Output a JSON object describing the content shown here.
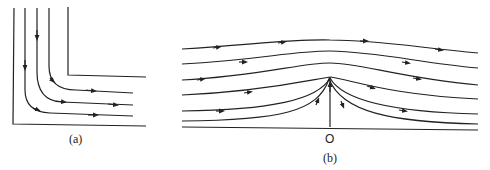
{
  "figure": {
    "panels": [
      {
        "id": "a",
        "label": "(a)",
        "description": "Flow around a right-angle corner; streamlines enter downward and exit to the right"
      },
      {
        "id": "b",
        "label": "(b)",
        "description": "Flow over a plane wall toward stagnation point O; streamlines converge at O and rise along the vertical"
      }
    ],
    "origin_label": "O",
    "stroke_color": "#222222",
    "background": "#ffffff"
  }
}
